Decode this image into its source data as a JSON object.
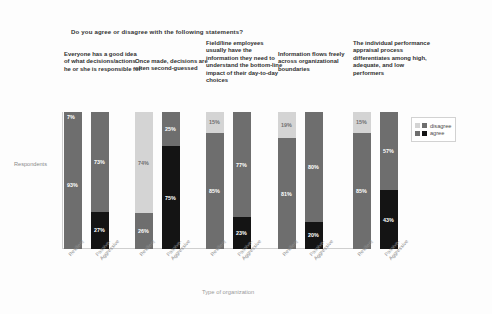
{
  "chart_data": {
    "type": "bar",
    "subtype": "stacked-100-percent",
    "title": "Do you agree or disagree with the following statements?",
    "xlabel": "Type of organization",
    "ylabel": "Respondents",
    "ylim": [
      0,
      100
    ],
    "grid": false,
    "legend_position": "right",
    "legend": [
      "disagree",
      "agree"
    ],
    "categories": [
      "Resilient",
      "Passive-\nAggressive"
    ],
    "colors": {
      "disagree_light": "#d4d4d4",
      "disagree_mid": "#6e6e6e",
      "agree_mid": "#6e6e6e",
      "agree_dark": "#141414",
      "axis": "#cfcfcf",
      "text": "#2f2f2f",
      "muted_text": "#8f8f8f"
    },
    "groups": [
      {
        "statement": "Everyone has a good idea of what decisions/actions he or she is responsible for",
        "bars": [
          {
            "category": "Resilient",
            "disagree": 7,
            "agree": 93,
            "disagree_tone": "mid",
            "agree_tone": "mid"
          },
          {
            "category": "Passive-Aggressive",
            "disagree": 73,
            "agree": 27,
            "disagree_tone": "mid",
            "agree_tone": "dark"
          }
        ]
      },
      {
        "statement": "Once made, decisions are often second-guessed",
        "bars": [
          {
            "category": "Resilient",
            "disagree": 74,
            "agree": 26,
            "disagree_tone": "light",
            "agree_tone": "mid"
          },
          {
            "category": "Passive-Aggressive",
            "disagree": 25,
            "agree": 75,
            "disagree_tone": "mid",
            "agree_tone": "dark"
          }
        ]
      },
      {
        "statement": "Field/line employees usually have the information they need to understand the bottom-line impact of their day-to-day choices",
        "bars": [
          {
            "category": "Resilient",
            "disagree": 15,
            "agree": 85,
            "disagree_tone": "light",
            "agree_tone": "mid"
          },
          {
            "category": "Passive-Aggressive",
            "disagree": 77,
            "agree": 23,
            "disagree_tone": "mid",
            "agree_tone": "dark"
          }
        ]
      },
      {
        "statement": "Information flows freely across organizational boundaries",
        "bars": [
          {
            "category": "Resilient",
            "disagree": 19,
            "agree": 81,
            "disagree_tone": "light",
            "agree_tone": "mid"
          },
          {
            "category": "Passive-Aggressive",
            "disagree": 80,
            "agree": 20,
            "disagree_tone": "mid",
            "agree_tone": "dark"
          }
        ]
      },
      {
        "statement": "The individual performance appraisal process differentiates among high, adequate, and low performers",
        "bars": [
          {
            "category": "Resilient",
            "disagree": 15,
            "agree": 85,
            "disagree_tone": "light",
            "agree_tone": "mid"
          },
          {
            "category": "Passive-Aggressive",
            "disagree": 57,
            "agree": 43,
            "disagree_tone": "mid",
            "agree_tone": "dark"
          }
        ]
      }
    ]
  },
  "footer": {
    "copyright": "Copyright © 2005 Harvard Business School Publishing Corporation. All rights reserved"
  }
}
